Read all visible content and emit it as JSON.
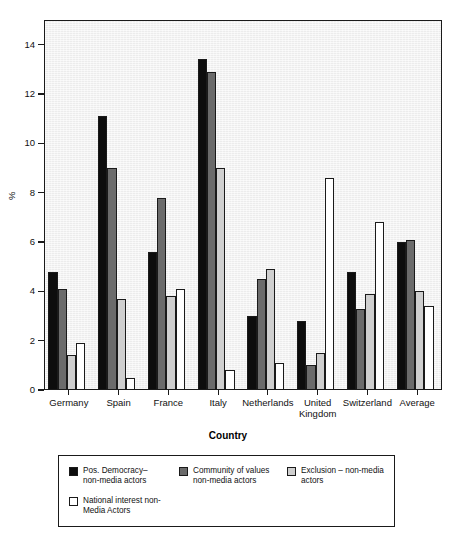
{
  "chart_data": {
    "type": "bar",
    "title": "",
    "subtitle": "",
    "xlabel": "Country",
    "ylabel": "%",
    "ylim": [
      0,
      15
    ],
    "yticks": [
      0,
      2,
      4,
      6,
      8,
      10,
      12,
      14
    ],
    "ytick_labels": [
      "0",
      "2",
      "4",
      "6",
      "8",
      "10",
      "12",
      "14"
    ],
    "grid": false,
    "legend_position": "below",
    "categories": [
      "Germany",
      "Spain",
      "France",
      "Italy",
      "Netherlands",
      "United\nKingdom",
      "Switzerland",
      "Average"
    ],
    "series": [
      {
        "name": "Pos. Democracy–\nnon-media actors",
        "color": "#0d0d0d",
        "values": [
          4.8,
          11.1,
          5.6,
          13.4,
          3.0,
          2.8,
          4.8,
          6.0
        ]
      },
      {
        "name": "Community of values\nnon-media actors",
        "color": "#6b6b6b",
        "values": [
          4.1,
          9.0,
          7.8,
          12.9,
          4.5,
          1.0,
          3.3,
          6.1
        ]
      },
      {
        "name": "Exclusion – non-media\nactors",
        "color": "#cfcfcf",
        "values": [
          1.4,
          3.7,
          3.8,
          9.0,
          4.9,
          1.5,
          3.9,
          4.0
        ]
      },
      {
        "name": "National interest non-\nMedia Actors",
        "color": "#ffffff",
        "values": [
          1.9,
          0.5,
          4.1,
          0.8,
          1.1,
          8.6,
          6.8,
          3.4
        ]
      }
    ]
  },
  "legend": {
    "entries": [
      {
        "label": "Pos. Democracy–\nnon-media actors",
        "color": "#0d0d0d"
      },
      {
        "label": "Community of values\nnon-media actors",
        "color": "#6b6b6b"
      },
      {
        "label": "Exclusion – non-media\nactors",
        "color": "#cfcfcf"
      },
      {
        "label": "National interest non-\nMedia Actors",
        "color": "#ffffff"
      }
    ]
  },
  "axes": {
    "x_title": "Country",
    "y_title": "%"
  }
}
